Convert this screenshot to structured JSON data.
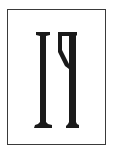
{
  "card": {
    "border_color": "#3a3a3a",
    "background": "#ffffff"
  },
  "glyphs": {
    "text": "IꟼI",
    "color": "#1a1a1a",
    "items": [
      {
        "name": "left-glyph",
        "char": "I"
      },
      {
        "name": "right-glyph",
        "char": "ꟼ"
      }
    ]
  }
}
